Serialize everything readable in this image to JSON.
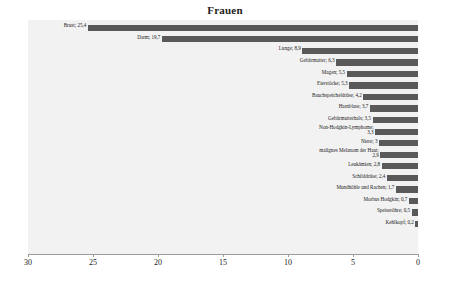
{
  "chart": {
    "title": "Frauen",
    "type": "bar",
    "orientation": "horizontal",
    "axis_reversed": true,
    "xlabel": "",
    "ylabel": "",
    "xlim": [
      30,
      0
    ],
    "grid": false,
    "legend": null,
    "bar_color": "#595959",
    "plot_background": "#f2f2f2",
    "axis_color": "#9c9c9c",
    "text_color": "#1a1a1a",
    "tick_labels": [
      "30",
      "25",
      "20",
      "15",
      "10",
      "5",
      "0"
    ],
    "tick_values": [
      30,
      25,
      20,
      15,
      10,
      5,
      0
    ]
  },
  "chart_data": {
    "type": "bar",
    "title": "Frauen",
    "xlabel": "",
    "ylabel": "",
    "xlim": [
      30,
      0
    ],
    "grid": false,
    "legend_position": "none",
    "orientation": "horizontal",
    "categories": [
      "Brust",
      "Darm",
      "Lunge",
      "Gebärmutter",
      "Magen",
      "Eierstöcke",
      "Bauchspeicheldrüse",
      "Harnblase",
      "Gebärmutterhals",
      "Non-Hodgkin-Lymphome",
      "Niere",
      "malignes Melanom der Haut",
      "Leukämien",
      "Schilddrüse",
      "Mundhöhle und Rachen",
      "Morbus Hodgkin",
      "Speiseröhre",
      "Kehlkopf"
    ],
    "values": [
      25.4,
      19.7,
      8.9,
      6.3,
      5.5,
      5.3,
      4.2,
      3.7,
      3.5,
      3.3,
      3,
      2.9,
      2.8,
      2.4,
      1.7,
      0.7,
      0.5,
      0.2
    ],
    "value_labels": [
      "25,4",
      "19,7",
      "8,9",
      "6,3",
      "5,5",
      "5,3",
      "4,2",
      "3,7",
      "3,5",
      "3,3",
      "3",
      "2,9",
      "2,8",
      "2,4",
      "1,7",
      "0,7",
      "0,5",
      "0,2"
    ],
    "bars": [
      {
        "label": "Brust; 25,4",
        "category": "Brust",
        "value": 25.4,
        "wrap": false
      },
      {
        "label": "Darm; 19,7",
        "category": "Darm",
        "value": 19.7,
        "wrap": false
      },
      {
        "label": "Lunge; 8,9",
        "category": "Lunge",
        "value": 8.9,
        "wrap": false
      },
      {
        "label": "Gebärmutter; 6,3",
        "category": "Gebärmutter",
        "value": 6.3,
        "wrap": false
      },
      {
        "label": "Magen; 5,5",
        "category": "Magen",
        "value": 5.5,
        "wrap": false
      },
      {
        "label": "Eierstöcke; 5,3",
        "category": "Eierstöcke",
        "value": 5.3,
        "wrap": false
      },
      {
        "label": "Bauchspeicheldrüse; 4,2",
        "category": "Bauchspeicheldrüse",
        "value": 4.2,
        "wrap": false
      },
      {
        "label": "Harnblase; 3,7",
        "category": "Harnblase",
        "value": 3.7,
        "wrap": false
      },
      {
        "label": "Gebärmutterhals; 3,5",
        "category": "Gebärmutterhals",
        "value": 3.5,
        "wrap": false
      },
      {
        "label": "Non-Hodgkin-Lymphome; 3,3",
        "category": "Non-Hodgkin-Lymphome",
        "value": 3.3,
        "wrap": true
      },
      {
        "label": "Niere; 3",
        "category": "Niere",
        "value": 3,
        "wrap": false
      },
      {
        "label": "malignes Melanom der Haut; 2,9",
        "category": "malignes Melanom der Haut",
        "value": 2.9,
        "wrap": true
      },
      {
        "label": "Leukämien; 2,8",
        "category": "Leukämien",
        "value": 2.8,
        "wrap": false
      },
      {
        "label": "Schilddrüse; 2,4",
        "category": "Schilddrüse",
        "value": 2.4,
        "wrap": false
      },
      {
        "label": "Mundhöhle und Rachen; 1,7",
        "category": "Mundhöhle und Rachen",
        "value": 1.7,
        "wrap": false
      },
      {
        "label": "Morbus Hodgkin; 0,7",
        "category": "Morbus Hodgkin",
        "value": 0.7,
        "wrap": false
      },
      {
        "label": "Speiseröhre; 0,5",
        "category": "Speiseröhre",
        "value": 0.5,
        "wrap": false
      },
      {
        "label": "Kehlkopf; 0,2",
        "category": "Kehlkopf",
        "value": 0.2,
        "wrap": false
      }
    ]
  }
}
